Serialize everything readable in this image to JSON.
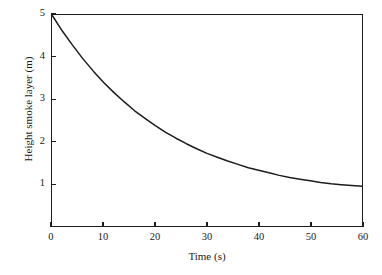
{
  "chart_data": {
    "type": "line",
    "title": "",
    "xlabel": "Time (s)",
    "ylabel": "Height smoke layer (m)",
    "xlim": [
      0,
      60
    ],
    "ylim": [
      0,
      5
    ],
    "xticks": [
      0,
      10,
      20,
      30,
      40,
      50,
      60
    ],
    "yticks": [
      1,
      2,
      3,
      4,
      5
    ],
    "xtick_labels": [
      "0",
      "10",
      "20",
      "30",
      "40",
      "50",
      "60"
    ],
    "ytick_labels": [
      "1",
      "2",
      "3",
      "4",
      "5"
    ],
    "grid": false,
    "legend": null,
    "line_color": "#1c1c1c",
    "series": [
      {
        "name": "Height smoke layer",
        "x": [
          0,
          2,
          4,
          6,
          8,
          10,
          12,
          14,
          16,
          18,
          20,
          22,
          24,
          26,
          28,
          30,
          32,
          34,
          36,
          38,
          40,
          42,
          44,
          46,
          48,
          50,
          52,
          54,
          56,
          58,
          60
        ],
        "values": [
          5.0,
          4.62,
          4.28,
          3.96,
          3.67,
          3.4,
          3.16,
          2.94,
          2.73,
          2.55,
          2.38,
          2.22,
          2.08,
          1.95,
          1.83,
          1.72,
          1.63,
          1.54,
          1.46,
          1.38,
          1.32,
          1.26,
          1.2,
          1.15,
          1.11,
          1.07,
          1.03,
          1.0,
          0.98,
          0.96,
          0.94
        ]
      }
    ]
  },
  "axes": {
    "x_title": "Time (s)",
    "y_title": "Height smoke layer (m)"
  }
}
